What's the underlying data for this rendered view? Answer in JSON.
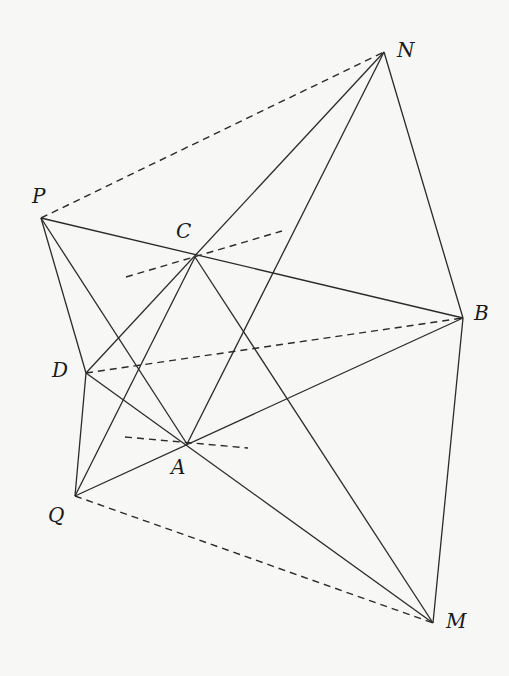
{
  "diagram": {
    "type": "geometry-figure",
    "points": {
      "P": {
        "label": "P",
        "x": 41,
        "y": 218,
        "lx": 32,
        "ly": 203
      },
      "N": {
        "label": "N",
        "x": 384,
        "y": 52,
        "lx": 397,
        "ly": 57
      },
      "C": {
        "label": "C",
        "x": 195,
        "y": 257,
        "lx": 176,
        "ly": 238
      },
      "B": {
        "label": "B",
        "x": 463,
        "y": 318,
        "lx": 474,
        "ly": 320
      },
      "D": {
        "label": "D",
        "x": 86,
        "y": 373,
        "lx": 52,
        "ly": 377
      },
      "A": {
        "label": "A",
        "x": 187,
        "y": 444,
        "lx": 171,
        "ly": 474
      },
      "Q": {
        "label": "Q",
        "x": 75,
        "y": 496,
        "lx": 48,
        "ly": 522
      },
      "M": {
        "label": "M",
        "x": 433,
        "y": 623,
        "lx": 446,
        "ly": 628
      }
    },
    "solid_segments": [
      [
        "P",
        "B"
      ],
      [
        "P",
        "D"
      ],
      [
        "P",
        "A"
      ],
      [
        "D",
        "Q"
      ],
      [
        "D",
        "N"
      ],
      [
        "Q",
        "C"
      ],
      [
        "C",
        "M"
      ],
      [
        "A",
        "N"
      ],
      [
        "Q",
        "B"
      ],
      [
        "D",
        "M"
      ],
      [
        "N",
        "B"
      ],
      [
        "B",
        "M"
      ]
    ],
    "dashed_segments": [
      [
        "P",
        "N"
      ],
      [
        "D",
        "B"
      ],
      [
        "Q",
        "M"
      ]
    ],
    "dashed_free_segments": [
      {
        "name": "dashed-line-through-C",
        "x1": 126,
        "y1": 277,
        "x2": 282,
        "y2": 231
      },
      {
        "name": "dashed-line-through-A",
        "x1": 125,
        "y1": 437,
        "x2": 248,
        "y2": 448
      }
    ]
  }
}
